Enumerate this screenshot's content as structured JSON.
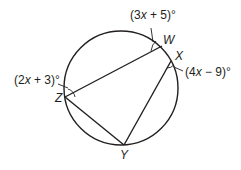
{
  "diagram": {
    "type": "inscribed-quadrilateral-in-circle",
    "points": {
      "W": {
        "label": "W"
      },
      "X": {
        "label": "X"
      },
      "Y": {
        "label": "Y"
      },
      "Z": {
        "label": "Z"
      }
    },
    "segments": [
      "ZW",
      "ZY",
      "YX"
    ],
    "angles": {
      "W": {
        "expr": "(3x + 5)°",
        "pre": "(3",
        "var": "x",
        "post": " + 5)°"
      },
      "X": {
        "expr": "(4x − 9)°",
        "pre": "(4",
        "var": "x",
        "post": " − 9)°"
      },
      "Z": {
        "expr": "(2x + 3)°",
        "pre": "(2",
        "var": "x",
        "post": " + 3)°"
      }
    },
    "colors": {
      "stroke": "#231f20",
      "background": "#ffffff"
    }
  }
}
